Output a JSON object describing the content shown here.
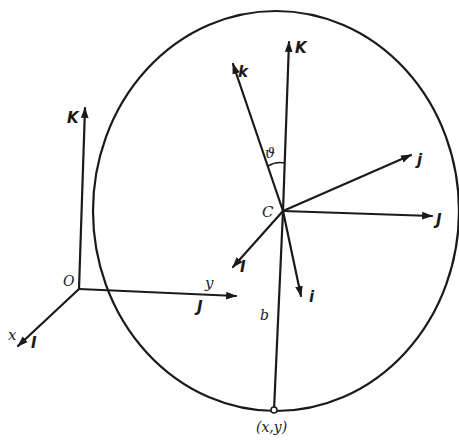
{
  "diagram": {
    "colors": {
      "ink": "#1a1a1a",
      "background": "#ffffff"
    },
    "fixed_frame": {
      "origin_label": "O",
      "axis_K_label": "K",
      "axis_y_label": "y",
      "axis_J_label": "J",
      "axis_x_label": "x",
      "axis_I_label": "I"
    },
    "disk": {
      "center_label": "C",
      "contact_point_label": "(x,y)",
      "radius_label": "b",
      "angle_label": "ϑ"
    },
    "body_frame": {
      "K_label": "K",
      "k_label": "k",
      "j_label": "j",
      "J_label": "J",
      "I_label": "I",
      "i_label": "i"
    }
  }
}
